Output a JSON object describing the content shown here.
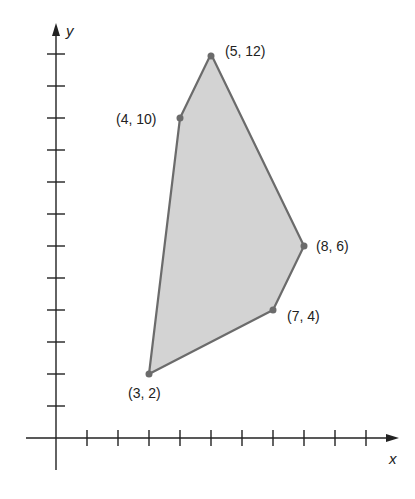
{
  "diagram": {
    "type": "polygon-on-coordinate-plane",
    "axes": {
      "x_label": "x",
      "y_label": "y",
      "x_ticks": [
        1,
        2,
        3,
        4,
        5,
        6,
        7,
        8,
        9,
        10
      ],
      "y_ticks": [
        1,
        2,
        3,
        4,
        5,
        6,
        7,
        8,
        9,
        10,
        11,
        12
      ]
    },
    "region": {
      "fill": "#d3d3d3",
      "stroke": "#6b6b6b",
      "vertices": [
        {
          "x": 3,
          "y": 2,
          "label": "(3, 2)"
        },
        {
          "x": 4,
          "y": 10,
          "label": "(4, 10)"
        },
        {
          "x": 5,
          "y": 12,
          "label": "(5, 12)"
        },
        {
          "x": 8,
          "y": 6,
          "label": "(8, 6)"
        },
        {
          "x": 7,
          "y": 4,
          "label": "(7, 4)"
        }
      ]
    }
  }
}
